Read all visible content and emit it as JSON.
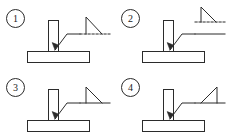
{
  "figure": {
    "type": "engineering-diagram",
    "panel_count": 4,
    "background_color": "#ffffff",
    "line_color": "#2b2b2b"
  },
  "panels": [
    {
      "id": 1,
      "number_label": "①",
      "number_plain": "1",
      "name": "option-1",
      "description": "Fillet weld triangle drawn above a dashed reference line; vertical leg on the left, hypotenuse descending to the right; leader line with arrow points to the T-joint root.",
      "reference_line_style": "dashed",
      "identification_line_style": "none",
      "triangle_vertical_leg": "left",
      "triangle_position": "above",
      "arrow_target": "joint-root"
    },
    {
      "id": 2,
      "number_label": "②",
      "number_plain": "2",
      "name": "option-2",
      "description": "Fillet weld triangle sitting on a dashed identification line, with a solid reference line below it; vertical leg on the left; leader line with arrow points to the T-joint root.",
      "reference_line_style": "solid",
      "identification_line_style": "dashed",
      "triangle_vertical_leg": "left",
      "triangle_position": "above",
      "arrow_target": "joint-root"
    },
    {
      "id": 3,
      "number_label": "③",
      "number_plain": "3",
      "name": "option-3",
      "description": "Fillet weld triangle above a solid reference line; vertical leg on the left, hypotenuse descending to the right; leader line with arrow points to the T-joint root.",
      "reference_line_style": "solid",
      "identification_line_style": "none",
      "triangle_vertical_leg": "left",
      "triangle_position": "above",
      "arrow_target": "joint-root"
    },
    {
      "id": 4,
      "number_label": "④",
      "number_plain": "4",
      "name": "option-4",
      "description": "Fillet weld triangle above a solid reference line; vertical leg on the right, hypotenuse rising from left to right; leader line with arrow points to the T-joint root.",
      "reference_line_style": "solid",
      "identification_line_style": "none",
      "triangle_vertical_leg": "right",
      "triangle_position": "above",
      "arrow_target": "joint-root"
    }
  ],
  "workpiece": {
    "name": "tee-joint",
    "base_plate": "horizontal rectangular plate",
    "web_plate": "vertical rectangular plate standing on the base plate"
  }
}
